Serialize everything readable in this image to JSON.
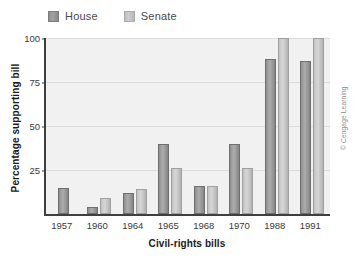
{
  "chart_data": {
    "type": "bar",
    "title": "",
    "xlabel": "Civil-rights bills",
    "ylabel": "Percentage supporting bill",
    "categories": [
      "1957",
      "1960",
      "1964",
      "1965",
      "1968",
      "1970",
      "1988",
      "1991"
    ],
    "series": [
      {
        "name": "House",
        "color": "#9c9c9c",
        "values": [
          15,
          4,
          12,
          40,
          16,
          40,
          88,
          87
        ]
      },
      {
        "name": "Senate",
        "color": "#cccccc",
        "values": [
          null,
          9,
          14,
          26,
          16,
          26,
          100,
          100
        ]
      }
    ],
    "ylim": [
      0,
      100
    ],
    "yticks": [
      25,
      50,
      75,
      100
    ],
    "ytick_labels": [
      "25",
      "50",
      "75",
      "100"
    ],
    "grid": "horizontal",
    "legend_position": "top-left",
    "plot_background": "#f1f1f1",
    "axis_color": "#3f3f3f",
    "gridline_color": "#dcdcdc"
  },
  "legend": {
    "entries": [
      {
        "label": "House",
        "swatch": "house-swatch"
      },
      {
        "label": "Senate",
        "swatch": "senate-swatch"
      }
    ]
  },
  "credit": "© Cengage Learning"
}
